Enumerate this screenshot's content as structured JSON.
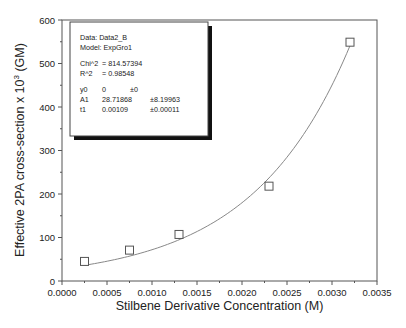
{
  "chart_data": {
    "type": "scatter",
    "title": "",
    "xlabel": "Stilbene Derivative Concentration (M)",
    "ylabel": "Effective 2PA cross-section x 10",
    "ylabel_superscript": "3",
    "ylabel_suffix": " (GM)",
    "xlim": [
      0.0,
      0.0035
    ],
    "ylim": [
      0,
      600
    ],
    "grid": false,
    "x_ticks": [
      "0.0000",
      "0.0005",
      "0.0010",
      "0.0015",
      "0.0020",
      "0.0025",
      "0.0030",
      "0.0035"
    ],
    "x_tick_values": [
      0.0,
      0.0005,
      0.001,
      0.0015,
      0.002,
      0.0025,
      0.003,
      0.0035
    ],
    "y_ticks": [
      "0",
      "100",
      "200",
      "300",
      "400",
      "500",
      "600"
    ],
    "y_tick_values": [
      0,
      100,
      200,
      300,
      400,
      500,
      600
    ],
    "series": [
      {
        "name": "Data2_B",
        "marker": "open-square",
        "x": [
          0.00025,
          0.00075,
          0.0013,
          0.0023,
          0.0032
        ],
        "y": [
          45,
          71,
          107,
          218,
          549
        ]
      }
    ],
    "fit": {
      "model": "ExpGro1",
      "equation": "y = y0 + A1*exp(x/t1)",
      "y0": 0,
      "A1": 28.71868,
      "t1": 0.00109,
      "x_range": [
        0.00025,
        0.0032
      ]
    },
    "legend_position": "top-left",
    "legend_lines": [
      {
        "cols": [
          "Data: Data2_B"
        ]
      },
      {
        "cols": [
          "Model: ExpGro1"
        ]
      },
      {
        "cols": []
      },
      {
        "cols": [
          "Chi^2",
          "= 814.57394"
        ]
      },
      {
        "cols": [
          "R^2",
          "= 0.98548"
        ]
      },
      {
        "cols": []
      },
      {
        "cols": [
          "y0",
          "0",
          "±0"
        ]
      },
      {
        "cols": [
          "A1",
          "28.71868",
          "±8.19963"
        ]
      },
      {
        "cols": [
          "t1",
          "0.00109",
          "±0.00011"
        ]
      }
    ]
  }
}
